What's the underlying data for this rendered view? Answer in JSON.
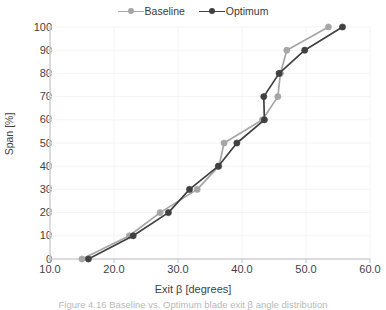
{
  "figure": {
    "caption": "Figure 4.16 Baseline vs. Optimum blade exit β angle distribution"
  },
  "legend": {
    "position": "top-center",
    "entries": [
      {
        "label": "Baseline",
        "color": "#a6a6a6",
        "marker": "circle"
      },
      {
        "label": "Optimum",
        "color": "#404040",
        "marker": "circle"
      }
    ]
  },
  "axes": {
    "x": {
      "label": "Exit β [degrees]",
      "ticks": [
        "10.0",
        "20.0",
        "30.0",
        "40.0",
        "50.0",
        "60.0"
      ],
      "min": 10.0,
      "max": 60.0
    },
    "y": {
      "label": "Span [%]",
      "ticks": [
        "0",
        "10",
        "20",
        "30",
        "40",
        "50",
        "60",
        "70",
        "80",
        "90",
        "100"
      ],
      "min": 0,
      "max": 100
    }
  },
  "chart_data": {
    "type": "line",
    "title": "",
    "xlabel": "Exit β [degrees]",
    "ylabel": "Span [%]",
    "xlim": [
      10.0,
      60.0
    ],
    "ylim": [
      0,
      100
    ],
    "xticks": [
      10.0,
      20.0,
      30.0,
      40.0,
      50.0,
      60.0
    ],
    "yticks": [
      0,
      10,
      20,
      30,
      40,
      50,
      60,
      70,
      80,
      90,
      100
    ],
    "grid": true,
    "grid_style": "very-faint-light-gray",
    "legend_position": "top-center",
    "orientation": "span-on-y",
    "series": [
      {
        "name": "Baseline",
        "color": "#a6a6a6",
        "marker": "circle",
        "span": [
          0,
          10,
          20,
          30,
          40,
          50,
          60,
          70,
          80,
          90,
          100
        ],
        "exit_beta": [
          15.0,
          22.4,
          27.2,
          33.0,
          36.4,
          37.2,
          43.2,
          45.6,
          46.0,
          47.0,
          53.5
        ]
      },
      {
        "name": "Optimum",
        "color": "#404040",
        "marker": "circle",
        "span": [
          0,
          10,
          20,
          30,
          40,
          50,
          60,
          70,
          80,
          90,
          100
        ],
        "exit_beta": [
          16.0,
          23.0,
          28.5,
          31.8,
          36.3,
          39.2,
          43.5,
          43.4,
          45.8,
          49.8,
          55.7
        ]
      }
    ]
  }
}
